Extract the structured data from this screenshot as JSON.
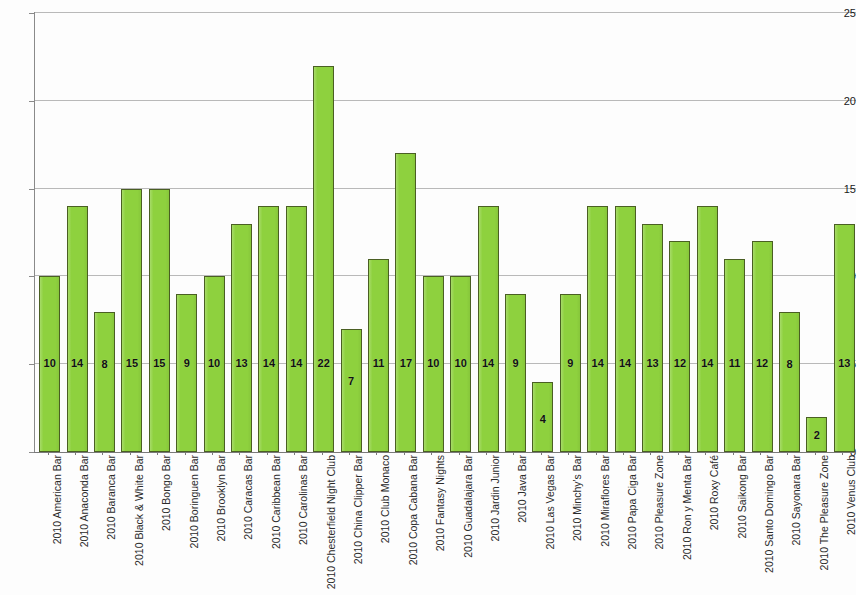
{
  "chart_data": {
    "type": "bar",
    "title": "",
    "xlabel": "",
    "ylabel": "",
    "ylim": [
      0,
      25
    ],
    "yticks": [
      0,
      5,
      10,
      15,
      20,
      25
    ],
    "grid": true,
    "legend": null,
    "value_labels": true,
    "bar_color": "#8ed13e",
    "bar_edge_color": "#4a5f23",
    "gridline_color": "#b9b9b9",
    "axis_color": "#8a8a8a",
    "categories": [
      "2010 American Bar",
      "2010 Anaconda Bar",
      "2010 Baranca Bar",
      "2010 Black & White Bar",
      "2010 Bongo Bar",
      "2010 Boringuen Bar",
      "2010 Brooklyn Bar",
      "2010 Caracas Bar",
      "2010 Caribbean Bar",
      "2010 Carolinas Bar",
      "2010 Chesterfield Night Club",
      "2010 China Clipper Bar",
      "2010 Club Monaco",
      "2010 Copa Cabana Bar",
      "2010 Fantasy Nights",
      "2010 Guadalajara Bar",
      "2010 Jardin Junior",
      "2010 Java Bar",
      "2010 Las Vegas Bar",
      "2010 Minchy's Bar",
      "2010 Miraflores Bar",
      "2010 Papa Ciga Bar",
      "2010 Pleasure Zone",
      "2010 Ron y Menta Bar",
      "2010 Roxy Café",
      "2010 Saikong Bar",
      "2010 Santo Domingo Bar",
      "2010 Sayonara Bar",
      "2010 The Pleasure Zone",
      "2010 Venus Club"
    ],
    "values": [
      10,
      14,
      8,
      15,
      15,
      9,
      10,
      13,
      14,
      14,
      22,
      7,
      11,
      17,
      10,
      10,
      14,
      9,
      4,
      9,
      14,
      14,
      13,
      12,
      14,
      11,
      12,
      8,
      2,
      13
    ]
  }
}
